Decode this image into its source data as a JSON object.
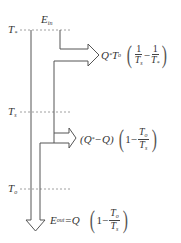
{
  "levels": {
    "t_star": {
      "symbol": "T",
      "sub": "*"
    },
    "t_s": {
      "symbol": "T",
      "sub": "s"
    },
    "t_0": {
      "symbol": "T",
      "sub": "o"
    }
  },
  "flows": {
    "e_in": {
      "symbol": "E",
      "sub": "in"
    },
    "branch1": {
      "prefix": "Q",
      "prefix_sup": "*",
      "factor": "T",
      "factor_sub": "o",
      "frac1_num": "1",
      "frac1_den": "T",
      "frac1_den_sub": "s",
      "minus": "−",
      "frac2_num": "1",
      "frac2_den": "T",
      "frac2_den_sub": "*"
    },
    "branch2": {
      "prefix": "(Q",
      "prefix_sup": "*",
      "prefix_rest": "−Q)",
      "one": "1",
      "minus": "−",
      "frac_num": "T",
      "frac_num_sub": "o",
      "frac_den": "T",
      "frac_den_sub": "s"
    },
    "e_out": {
      "symbol": "E",
      "sub": "out",
      "eq": "=Q",
      "one": "1",
      "minus": "−",
      "frac_num": "T",
      "frac_num_sub": "o",
      "frac_den": "T",
      "frac_den_sub": "s"
    }
  },
  "colors": {
    "line": "#555555",
    "dashed": "#888888",
    "text": "#333333"
  }
}
